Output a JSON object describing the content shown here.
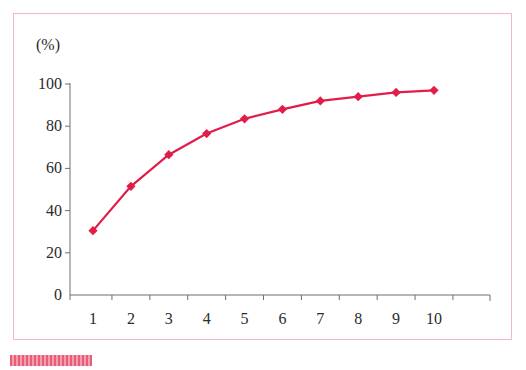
{
  "figure": {
    "background_color": "#ffffff",
    "frame_color": "#f3b9c2",
    "axis_color": "#6e6e6e",
    "series_color": "#e11d48",
    "margin_mark_color": "#e8536f"
  },
  "chart_data": {
    "type": "line",
    "title": "",
    "subtitle": "",
    "xlabel": "",
    "ylabel": "(%)",
    "unit_label": "(%)",
    "x": [
      1,
      2,
      3,
      4,
      5,
      6,
      7,
      8,
      9,
      10
    ],
    "categories": [
      "1",
      "2",
      "3",
      "4",
      "5",
      "6",
      "7",
      "8",
      "9",
      "10"
    ],
    "values": [
      30.5,
      51.5,
      66.5,
      76.5,
      83.5,
      88,
      92,
      94,
      96,
      97
    ],
    "series": [
      {
        "name": "",
        "color": "#e11d48",
        "marker": "diamond",
        "values": [
          30.5,
          51.5,
          66.5,
          76.5,
          83.5,
          88,
          92,
          94,
          96,
          97
        ]
      }
    ],
    "xlim": [
      0.3,
      10.7
    ],
    "ylim": [
      0,
      100
    ],
    "yticks": [
      0,
      20,
      40,
      60,
      80,
      100
    ],
    "ytick_labels": [
      "0",
      "20",
      "40",
      "60",
      "80",
      "100"
    ],
    "xtick_labels": [
      "1",
      "2",
      "3",
      "4",
      "5",
      "6",
      "7",
      "8",
      "9",
      "10"
    ],
    "grid": false,
    "legend": null,
    "legend_position": "none",
    "annotations": []
  }
}
